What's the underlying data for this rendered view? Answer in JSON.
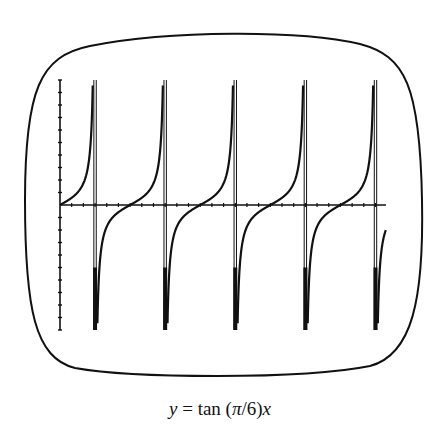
{
  "caption": {
    "lhs": "y",
    "eq": " = tan (",
    "pi": "π",
    "rest": "/6)",
    "var": "x",
    "full": "y = tan (π/6)x"
  },
  "chart_data": {
    "type": "line",
    "title": "y = tan (π/6)x",
    "function": "tan(pi*x/6)",
    "xlabel": "",
    "ylabel": "",
    "xlim": [
      0,
      27.9
    ],
    "ylim": [
      -10,
      10
    ],
    "x_tick_step": 1,
    "y_tick_step": 1,
    "tick_labels": false,
    "grid": false,
    "legend": null,
    "period": 6,
    "vertical_asymptotes": [
      3,
      9,
      15,
      21,
      27
    ],
    "zeros": [
      0,
      6,
      12,
      18,
      24
    ],
    "series": [
      {
        "name": "tan(πx/6)",
        "x": [
          0,
          1,
          2,
          2.5,
          2.8,
          3.2,
          3.5,
          4,
          5,
          6,
          7,
          8,
          8.5,
          8.8
        ],
        "y": [
          0,
          0.577,
          1.732,
          3.732,
          9.514,
          -9.514,
          -3.732,
          -1.732,
          -0.577,
          0,
          0.577,
          1.732,
          3.732,
          9.514
        ]
      }
    ],
    "frame": "rounded calculator screen border",
    "colors": {
      "ink": "#111111",
      "background": "#ffffff"
    }
  }
}
